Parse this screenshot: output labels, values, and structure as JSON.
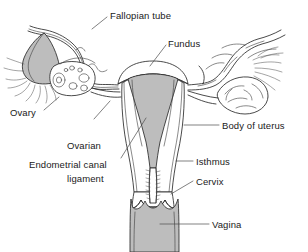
{
  "figure": {
    "type": "anatomical-line-diagram",
    "width": 308,
    "height": 252,
    "background_color": "#ffffff",
    "line_color": "#2b2b2b",
    "shading_color": "#bdbdbd",
    "text_color": "#1a1a1a"
  },
  "labels": [
    {
      "id": "fallopian-tube",
      "text": "Fallopian tube",
      "x": 110,
      "y": 10,
      "leader": {
        "x1": 107,
        "y1": 17,
        "x2": 92,
        "y2": 29
      }
    },
    {
      "id": "fundus",
      "text": "Fundus",
      "x": 168,
      "y": 38,
      "leader": {
        "x1": 166,
        "y1": 45,
        "x2": 150,
        "y2": 66
      }
    },
    {
      "id": "ovary",
      "text": "Ovary",
      "x": 10,
      "y": 107,
      "leader": {
        "x1": 44,
        "y1": 110,
        "x2": 59,
        "y2": 97
      }
    },
    {
      "id": "ovarian-ligament",
      "text": "Ovarian\nligament",
      "line1": "Ovarian",
      "line2": "ligament",
      "x": 67,
      "y": 118,
      "leader": {
        "x1": 94,
        "y1": 119,
        "x2": 110,
        "y2": 101
      }
    },
    {
      "id": "endometrial-canal",
      "text": "Endometrial canal",
      "x": 29,
      "y": 159,
      "leader": {
        "x1": 121,
        "y1": 158,
        "x2": 146,
        "y2": 118
      }
    },
    {
      "id": "body-of-uterus",
      "text": "Body of uterus",
      "x": 222,
      "y": 120,
      "leader": {
        "x1": 219,
        "y1": 125,
        "x2": 184,
        "y2": 125
      }
    },
    {
      "id": "isthmus",
      "text": "Isthmus",
      "x": 196,
      "y": 156,
      "leader": {
        "x1": 193,
        "y1": 161,
        "x2": 176,
        "y2": 161
      }
    },
    {
      "id": "cervix",
      "text": "Cervix",
      "x": 196,
      "y": 176,
      "leader": {
        "x1": 193,
        "y1": 181,
        "x2": 171,
        "y2": 194
      }
    },
    {
      "id": "vagina",
      "text": "Vagina",
      "x": 212,
      "y": 219,
      "leader": {
        "x1": 209,
        "y1": 224,
        "x2": 160,
        "y2": 224
      }
    }
  ],
  "structures": [
    {
      "id": "uterus-fundus",
      "name": "Fundus of uterus",
      "shaded": false
    },
    {
      "id": "uterine-cavity",
      "name": "Endometrial canal / uterine cavity",
      "shaded": true
    },
    {
      "id": "uterus-body",
      "name": "Body of uterus",
      "shaded": false
    },
    {
      "id": "isthmus",
      "name": "Isthmus",
      "shaded": false
    },
    {
      "id": "cervix",
      "name": "Cervix",
      "shaded": false
    },
    {
      "id": "cervical-canal",
      "name": "Cervical canal with plicae",
      "shaded": false
    },
    {
      "id": "vagina",
      "name": "Vagina",
      "shaded": true
    },
    {
      "id": "left-fallopian-tube",
      "name": "Left fallopian tube",
      "shaded": false
    },
    {
      "id": "right-fallopian-tube",
      "name": "Right fallopian tube",
      "shaded": false
    },
    {
      "id": "left-infundibulum",
      "name": "Left infundibulum",
      "shaded": true
    },
    {
      "id": "left-fimbriae",
      "name": "Left fimbriae",
      "shaded": false
    },
    {
      "id": "right-fimbriae",
      "name": "Right fimbriae",
      "shaded": false
    },
    {
      "id": "left-ovary",
      "name": "Left ovary with follicles",
      "shaded": false
    },
    {
      "id": "right-ovary",
      "name": "Right ovary",
      "shaded": false
    },
    {
      "id": "left-ovarian-ligament",
      "name": "Left ovarian ligament",
      "shaded": false
    },
    {
      "id": "right-ovarian-ligament",
      "name": "Right ovarian ligament",
      "shaded": false
    }
  ]
}
